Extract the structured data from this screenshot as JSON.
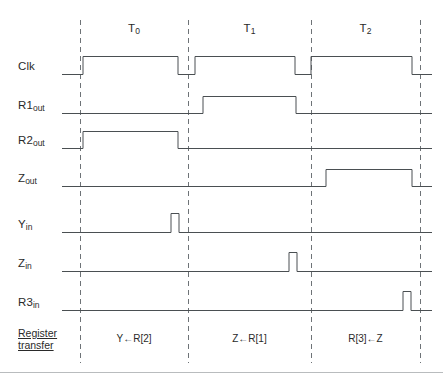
{
  "figure": {
    "type": "timing-diagram",
    "background_color": "#ffffff",
    "waveform_color": "#4a4f52",
    "boundary_color": "#6e7377",
    "text_color": "#2a2a2a"
  },
  "periods": [
    {
      "id": "T0",
      "name": "T",
      "sub": "0",
      "start_x": 80,
      "end_x": 188,
      "center_x": 134
    },
    {
      "id": "T1",
      "name": "T",
      "sub": "1",
      "start_x": 188,
      "end_x": 311,
      "center_x": 249.5
    },
    {
      "id": "T2",
      "name": "T",
      "sub": "2",
      "start_x": 311,
      "end_x": 420,
      "center_x": 365.5
    }
  ],
  "boundaries": [
    80,
    188,
    311,
    420
  ],
  "signals": [
    {
      "id": "clk",
      "name": "Clk",
      "sub": "",
      "baseline_y": 74,
      "high_y": 56,
      "edges": [
        83,
        178,
        195,
        295,
        311,
        412
      ]
    },
    {
      "id": "r1out",
      "name": "R1",
      "sub": "out",
      "baseline_y": 113,
      "high_y": 96,
      "edges": [
        203,
        296
      ]
    },
    {
      "id": "r2out",
      "name": "R2",
      "sub": "out",
      "baseline_y": 148,
      "high_y": 131,
      "edges": [
        83,
        178
      ]
    },
    {
      "id": "zout",
      "name": "Z",
      "sub": "out",
      "baseline_y": 186,
      "high_y": 169,
      "edges": [
        326,
        412
      ]
    },
    {
      "id": "yin",
      "name": "Y",
      "sub": "in",
      "baseline_y": 232,
      "high_y": 213,
      "edges": [
        171,
        179
      ]
    },
    {
      "id": "zin",
      "name": "Z",
      "sub": "in",
      "baseline_y": 271,
      "high_y": 252,
      "edges": [
        289,
        297
      ]
    },
    {
      "id": "r3in",
      "name": "R3",
      "sub": "in",
      "baseline_y": 310,
      "high_y": 291,
      "edges": [
        403,
        411
      ]
    }
  ],
  "register_transfer": {
    "row_label_line1": "Register",
    "row_label_line2": "transfer",
    "entries": [
      {
        "period": "T0",
        "text": "Y←R[2]",
        "center_x": 134,
        "y": 339
      },
      {
        "period": "T1",
        "text": "Z←R[1]",
        "center_x": 249.5,
        "y": 339
      },
      {
        "period": "T2",
        "text": "R[3]←Z",
        "center_x": 365.5,
        "y": 339
      }
    ]
  },
  "geometry": {
    "wave_start_x": 62,
    "wave_end_x": 432,
    "dash_top_y": 20,
    "dash_bottom_y": 363,
    "bottom_rule_y": 372
  },
  "chart_data": {
    "type": "line",
    "xlabel": "Time (clock periods)",
    "ylabel": "Signal level",
    "categories": [
      "T0",
      "T1",
      "T2"
    ],
    "series": [
      {
        "name": "Clk",
        "values": "square wave: high during most of each period, low at period boundaries"
      },
      {
        "name": "R1out",
        "values": [
          0,
          1,
          0
        ]
      },
      {
        "name": "R2out",
        "values": [
          1,
          0,
          0
        ]
      },
      {
        "name": "Zout",
        "values": [
          0,
          0,
          1
        ]
      },
      {
        "name": "Yin",
        "values": "pulse at end of T0"
      },
      {
        "name": "Zin",
        "values": "pulse at end of T1"
      },
      {
        "name": "R3in",
        "values": "pulse at end of T2"
      }
    ],
    "annotations": [
      "Y←R[2]",
      "Z←R[1]",
      "R[3]←Z"
    ],
    "grid": false,
    "legend": "left-axis labels"
  }
}
